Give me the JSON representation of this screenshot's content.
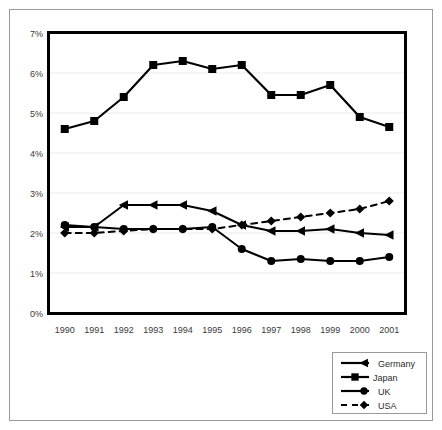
{
  "chart_data": {
    "type": "line",
    "title": "",
    "xlabel": "",
    "ylabel": "",
    "x": [
      "1990",
      "1991",
      "1992",
      "1993",
      "1994",
      "1995",
      "1996",
      "1997",
      "1998",
      "1999",
      "2000",
      "2001"
    ],
    "categories": [
      "1990",
      "1991",
      "1992",
      "1993",
      "1994",
      "1995",
      "1996",
      "1997",
      "1998",
      "1999",
      "2000",
      "2001"
    ],
    "ylim": [
      0,
      7
    ],
    "yticks": [
      0,
      1,
      2,
      3,
      4,
      5,
      6,
      7
    ],
    "ytick_labels": [
      "0%",
      "1%",
      "2%",
      "3%",
      "4%",
      "5%",
      "6%",
      "7%"
    ],
    "grid": true,
    "legend_position": "bottom-right",
    "series": [
      {
        "name": "Germany",
        "marker": "triangle",
        "line_style": "solid",
        "color": "#000000",
        "values": [
          2.15,
          2.15,
          2.7,
          2.7,
          2.7,
          2.55,
          2.2,
          2.05,
          2.05,
          2.1,
          2.0,
          1.95
        ]
      },
      {
        "name": "Japan",
        "marker": "square",
        "line_style": "solid",
        "color": "#000000",
        "values": [
          4.6,
          4.8,
          5.4,
          6.2,
          6.3,
          6.1,
          6.2,
          5.45,
          5.45,
          5.7,
          4.9,
          4.65
        ]
      },
      {
        "name": "UK",
        "marker": "circle",
        "line_style": "solid",
        "color": "#000000",
        "values": [
          2.2,
          2.15,
          2.1,
          2.1,
          2.1,
          2.15,
          1.6,
          1.3,
          1.35,
          1.3,
          1.3,
          1.4
        ]
      },
      {
        "name": "USA",
        "marker": "diamond",
        "line_style": "dashed",
        "color": "#000000",
        "values": [
          2.0,
          2.0,
          2.05,
          2.1,
          2.1,
          2.1,
          2.2,
          2.3,
          2.4,
          2.5,
          2.6,
          2.8
        ]
      }
    ]
  },
  "legend": {
    "entries": [
      {
        "label": "Germany"
      },
      {
        "label": "Japan"
      },
      {
        "label": "UK"
      },
      {
        "label": "USA"
      }
    ]
  },
  "axes": {
    "y_tick_labels": [
      "7%",
      "6%",
      "5%",
      "4%",
      "3%",
      "2%",
      "1%",
      "0%"
    ],
    "x_tick_labels": [
      "1990",
      "1991",
      "1992",
      "1993",
      "1994",
      "1995",
      "1996",
      "1997",
      "1998",
      "1999",
      "2000",
      "2001"
    ]
  }
}
